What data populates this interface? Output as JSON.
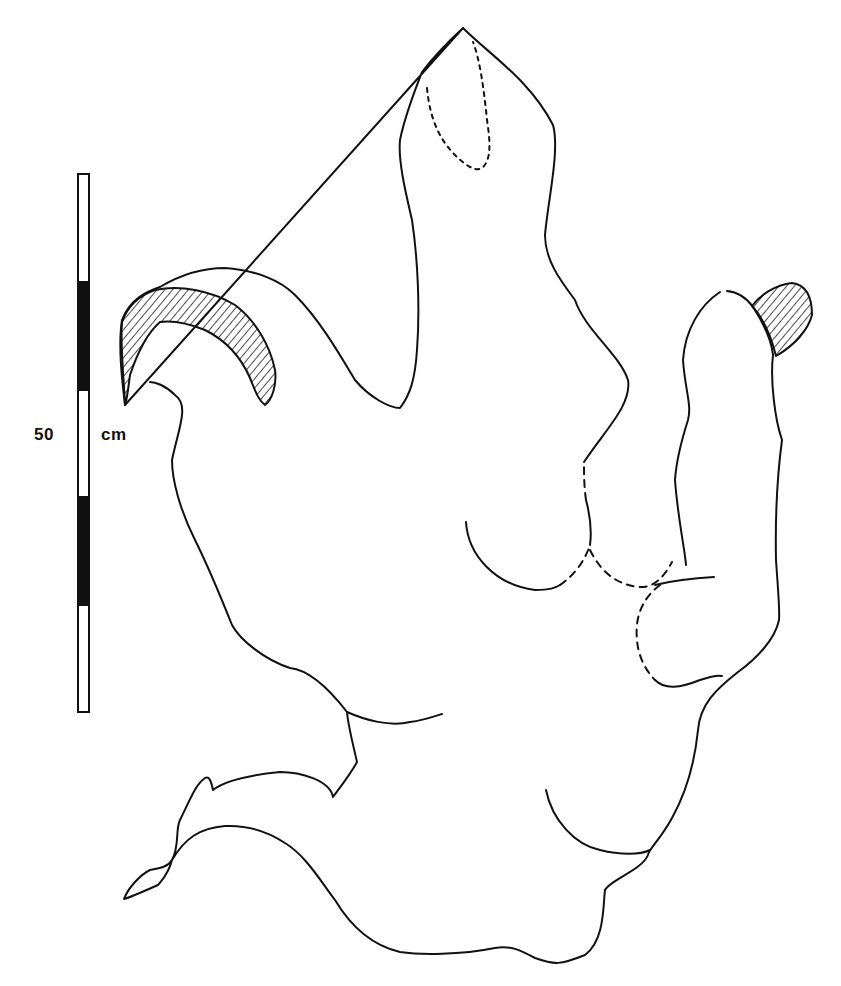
{
  "figure": {
    "scale_bar": {
      "label_value": "50",
      "label_unit": "cm",
      "segments": [
        "white",
        "black",
        "white",
        "black",
        "white"
      ]
    },
    "colors": {
      "ink": "#111111",
      "paper": "#ffffff"
    },
    "hatched_regions": [
      "left-claw",
      "right-claw"
    ],
    "dashed_regions": [
      "tall-digit-tip",
      "central-pad",
      "right-pad"
    ]
  }
}
